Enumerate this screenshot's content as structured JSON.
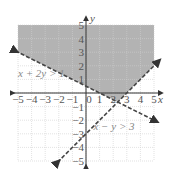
{
  "chart_data": {
    "type": "line",
    "title": "",
    "xlabel": "x",
    "ylabel": "y",
    "xlim": [
      -5,
      5
    ],
    "ylim": [
      -5,
      5
    ],
    "grid": true,
    "x_ticks": [
      "−5",
      "−4",
      "−3",
      "−2",
      "−1",
      "0",
      "1",
      "2",
      "3",
      "4",
      "5"
    ],
    "y_ticks": [
      "5",
      "4",
      "3",
      "2",
      "1",
      "−1",
      "−2",
      "−3",
      "−4",
      "−5"
    ],
    "series": [
      {
        "name": "x + 2y > 1",
        "style": "dashed",
        "boundary": "x + 2y = 1",
        "points": [
          [
            -5,
            3
          ],
          [
            5,
            -2
          ]
        ]
      },
      {
        "name": "x − y > 3",
        "style": "dashed",
        "boundary": "x − y = 3",
        "points": [
          [
            -2,
            -5
          ],
          [
            5,
            2
          ]
        ]
      }
    ],
    "shaded_region": {
      "description": "Solution region above x + 2y = 1 and above x − y = 3",
      "vertices": [
        [
          -5,
          5
        ],
        [
          5,
          5
        ],
        [
          5,
          2
        ],
        [
          2.33,
          -0.67
        ],
        [
          -5,
          3
        ]
      ],
      "color": "#b3b3b3"
    },
    "annotations": [
      {
        "text": "x + 2y > 1",
        "x": -5,
        "y": 1.3
      },
      {
        "text": "x − y > 3",
        "x": 0.5,
        "y": -3
      }
    ]
  },
  "labels": {
    "x_axis": "x",
    "y_axis": "y",
    "ineq1": "x + 2y > 1",
    "ineq2": "x − y > 3"
  }
}
